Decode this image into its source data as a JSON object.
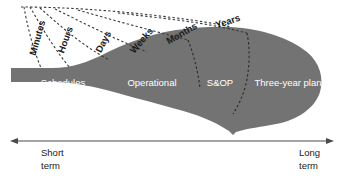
{
  "diagram": {
    "type": "funnel-timeline",
    "colors": {
      "funnel_fill": "#737373",
      "funnel_label_text": "#ffffff",
      "time_unit_text": "#1a1a1a",
      "dashed_line_outside": "#3a3a3a",
      "dashed_line_inside": "#2e2e2e",
      "axis_line": "#4a4a4a",
      "background": "#ffffff"
    },
    "funnel_segments": [
      {
        "id": "schedules",
        "label": "Schedules",
        "x": 63,
        "y": 83
      },
      {
        "id": "operational",
        "label": "Operational",
        "x": 152,
        "y": 83
      },
      {
        "id": "sandop",
        "label": "S&OP",
        "x": 220,
        "y": 83
      },
      {
        "id": "three-year-plan",
        "label": "Three-year plan",
        "x": 288,
        "y": 83
      }
    ],
    "time_units": [
      {
        "id": "minutes",
        "label": "Minutes",
        "x": 38,
        "y": 38,
        "rotate": -74
      },
      {
        "id": "hours",
        "label": "Hours",
        "x": 66,
        "y": 40,
        "rotate": -70
      },
      {
        "id": "days",
        "label": "Days",
        "x": 104,
        "y": 42,
        "rotate": -63
      },
      {
        "id": "weeks",
        "label": "Weeks",
        "x": 142,
        "y": 41,
        "rotate": -50
      },
      {
        "id": "months",
        "label": "Months",
        "x": 182,
        "y": 34,
        "rotate": -30
      },
      {
        "id": "years",
        "label": "Years",
        "x": 228,
        "y": 22,
        "rotate": -18
      }
    ],
    "axis": {
      "start_label_line1": "Short",
      "start_label_line2": "term",
      "end_label_line1": "Long",
      "end_label_line2": "term",
      "left_arrow_x": 13,
      "right_arrow_x": 331,
      "y": 141
    }
  }
}
